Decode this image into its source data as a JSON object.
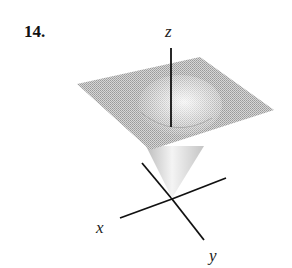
{
  "figure": {
    "number_label": "14.",
    "axes": {
      "x_label": "x",
      "y_label": "y",
      "z_label": "z"
    },
    "colors": {
      "surface": "#bdbdbd",
      "surface_light": "#e8e8e8",
      "axis": "#111111",
      "background": "#ffffff"
    }
  }
}
